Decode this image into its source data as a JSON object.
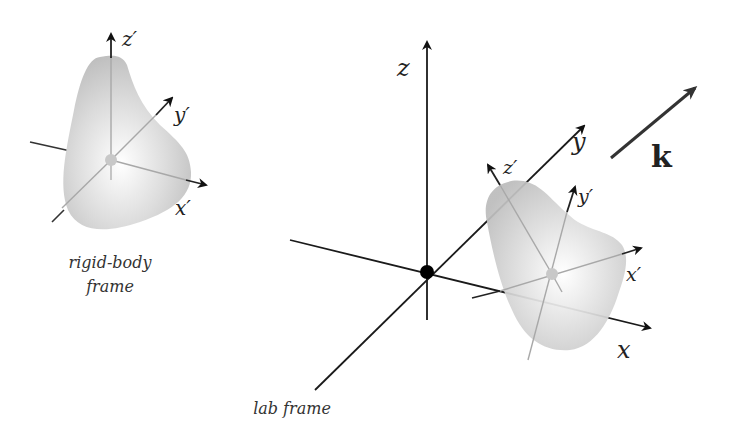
{
  "diagram": {
    "rigid_body_frame": {
      "caption_line1": "rigid-body",
      "caption_line2": "frame",
      "axes": {
        "x": "x′",
        "y": "y′",
        "z": "z′"
      }
    },
    "lab_frame": {
      "caption": "lab frame",
      "axes": {
        "x": "x",
        "y": "y",
        "z": "z"
      },
      "body_axes": {
        "x": "x′",
        "y": "y′",
        "z": "z′"
      }
    },
    "wave_vector": {
      "label": "k"
    },
    "colors": {
      "axis": "#1a1a1a",
      "body_axis": "#aaaaaa",
      "body_fill_light": "#f7f7f7",
      "body_fill_dark": "#b8b8b8",
      "k_arrow": "#333333"
    }
  }
}
